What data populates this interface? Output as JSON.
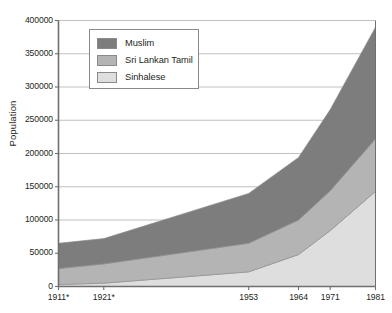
{
  "chart_data": {
    "type": "area",
    "stacked": true,
    "title": "",
    "xlabel": "",
    "ylabel": "Population",
    "x": [
      1911,
      1921,
      1953,
      1964,
      1971,
      1981
    ],
    "categories": [
      "1911*",
      "1921*",
      "1953",
      "1964",
      "1971",
      "1981"
    ],
    "xlim": [
      1911,
      1981
    ],
    "ylim": [
      0,
      400000
    ],
    "ytick_values": [
      0,
      50000,
      100000,
      150000,
      200000,
      250000,
      300000,
      350000,
      400000
    ],
    "ytick_labels": [
      "0",
      "50000",
      "100000",
      "150000",
      "200000",
      "250000",
      "300000",
      "350000",
      "400000"
    ],
    "grid": true,
    "legend_position": "top-left",
    "series": [
      {
        "name": "Sinhalese",
        "color": "#dedede",
        "values": [
          3000,
          5000,
          22000,
          48000,
          84000,
          143000
        ]
      },
      {
        "name": "Sri Lankan Tamil",
        "color": "#b4b4b4",
        "values": [
          24000,
          29000,
          43000,
          52000,
          60000,
          79000
        ]
      },
      {
        "name": "Muslim",
        "color": "#7d7d7d",
        "values": [
          38000,
          38000,
          75000,
          94000,
          122000,
          168000
        ]
      }
    ],
    "series_order_bottom_to_top": [
      "Sinhalese",
      "Sri Lankan Tamil",
      "Muslim"
    ],
    "cumulative_totals": [
      65000,
      72000,
      140000,
      194000,
      266000,
      390000
    ],
    "legend_entries": [
      "Muslim",
      "Sri Lankan Tamil",
      "Sinhalese"
    ],
    "colors": {
      "muslim": "#7d7d7d",
      "sri_lankan_tamil": "#b4b4b4",
      "sinhalese": "#dedede",
      "axis": "#6f6f6f",
      "grid": "#b9b9b9",
      "text": "#231f20"
    }
  }
}
